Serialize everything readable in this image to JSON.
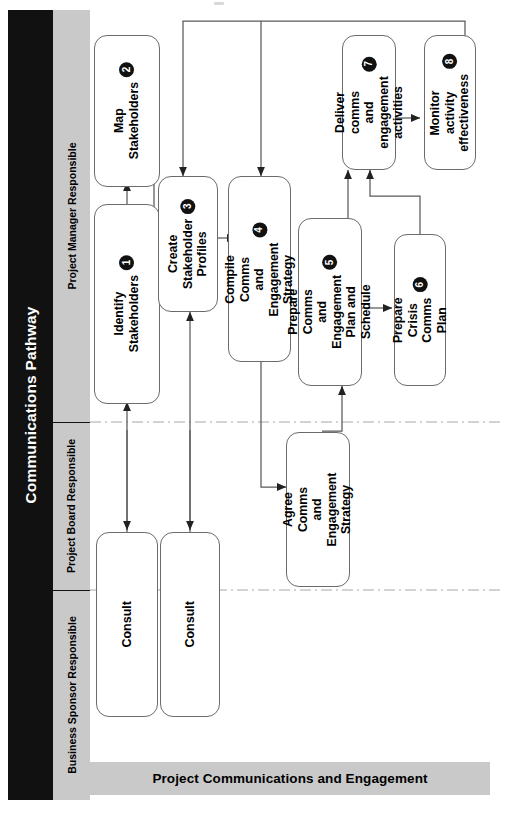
{
  "banner": {
    "title": "Communications Pathway"
  },
  "footer": {
    "label": "Project  Communications and Engagement"
  },
  "lanes": [
    {
      "id": "project-manager",
      "label": "Project Manager Responsible"
    },
    {
      "id": "project-board",
      "label": "Project Board\nResponsible"
    },
    {
      "id": "business-sponsor",
      "label": "Business Sponsor\nResponsible"
    }
  ],
  "nodes": [
    {
      "id": "identify-stakeholders",
      "label": "Identify\nStakeholders",
      "number": "1",
      "lane": "project-manager"
    },
    {
      "id": "map-stakeholders",
      "label": "Map\nStakeholders",
      "number": "2",
      "lane": "project-manager"
    },
    {
      "id": "create-stakeholder-profiles",
      "label": "Create\nStakeholder\nProfiles",
      "number": "3",
      "lane": "project-manager"
    },
    {
      "id": "compile-comms-strategy",
      "label": "Compile Comms\nand Engagement\nStrategy",
      "number": "4",
      "lane": "project-manager"
    },
    {
      "id": "prepare-comms-plan",
      "label": "Prepare Comms\nand Engagement\nPlan and\nSchedule",
      "number": "5",
      "lane": "project-manager"
    },
    {
      "id": "prepare-crisis-comms-plan",
      "label": "Prepare Crisis\nComms Plan",
      "number": "6",
      "lane": "project-manager"
    },
    {
      "id": "deliver-comms-activities",
      "label": "Deliver comms\nand engagement\nactivities",
      "number": "7",
      "lane": "project-manager"
    },
    {
      "id": "monitor-activity-effectiveness",
      "label": "Monitor activity\neffectiveness",
      "number": "8",
      "lane": "project-manager"
    },
    {
      "id": "agree-comms-strategy",
      "label": "Agree Comms\nand Engagement\nStrategy",
      "number": "",
      "lane": "project-board"
    },
    {
      "id": "consult-1",
      "label": "Consult",
      "number": "",
      "lane": "project-board"
    },
    {
      "id": "consult-2",
      "label": "Consult",
      "number": "",
      "lane": "project-board"
    }
  ],
  "colors": {
    "banner_background": "#111111",
    "banner_text": "#ffffff",
    "lane_background": "#c9c9c9",
    "node_border": "#6b6b6b",
    "node_background": "#ffffff",
    "badge_background": "#111111",
    "connector": "#5a5a5a",
    "lane_divider": "#9a9a9a"
  }
}
